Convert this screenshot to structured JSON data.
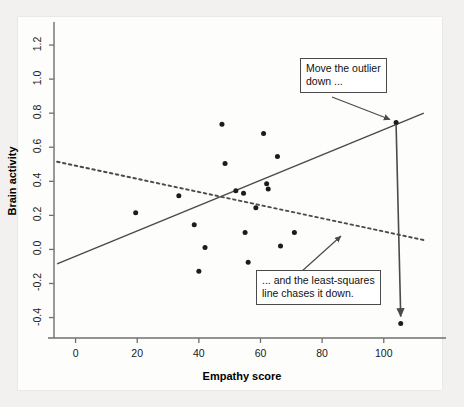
{
  "figure": {
    "background_color": "#f2f1ef",
    "panel_color": "#fdfdfc",
    "point_color": "#1c1c1c",
    "line_color": "#4b4b4b"
  },
  "annotations": {
    "top": {
      "line1": "Move the outlier",
      "line2": "down ..."
    },
    "bottom": {
      "line1": "... and the least-squares",
      "line2": "line chases it down."
    }
  },
  "chart_data": {
    "type": "scatter",
    "title": "",
    "xlabel": "Empathy score",
    "ylabel": "Brain activity",
    "xlim": [
      -7,
      115
    ],
    "ylim": [
      -0.52,
      1.3
    ],
    "xticks": [
      0,
      20,
      40,
      60,
      80,
      100
    ],
    "xticklabels": [
      "0",
      "20",
      "40",
      "60",
      "80",
      "100"
    ],
    "yticks": [
      -0.4,
      -0.2,
      0.0,
      0.2,
      0.4,
      0.6,
      0.8,
      1.0,
      1.2
    ],
    "yticklabels": [
      "-0.4",
      "-0.2",
      "0.0",
      "0.2",
      "0.4",
      "0.6",
      "0.8",
      "1.0",
      "1.2"
    ],
    "grid": false,
    "legend": false,
    "points": [
      {
        "x": 19.5,
        "y": 0.215
      },
      {
        "x": 33.5,
        "y": 0.315
      },
      {
        "x": 38.5,
        "y": 0.145
      },
      {
        "x": 40.0,
        "y": -0.128
      },
      {
        "x": 42.0,
        "y": 0.012
      },
      {
        "x": 47.5,
        "y": 0.735
      },
      {
        "x": 48.5,
        "y": 0.505
      },
      {
        "x": 52.0,
        "y": 0.345
      },
      {
        "x": 54.5,
        "y": 0.33
      },
      {
        "x": 55.0,
        "y": 0.1
      },
      {
        "x": 56.0,
        "y": -0.075
      },
      {
        "x": 58.5,
        "y": 0.245
      },
      {
        "x": 61.0,
        "y": 0.68
      },
      {
        "x": 62.0,
        "y": 0.385
      },
      {
        "x": 62.5,
        "y": 0.355
      },
      {
        "x": 65.5,
        "y": 0.545
      },
      {
        "x": 66.5,
        "y": 0.02
      },
      {
        "x": 71.0,
        "y": 0.1
      },
      {
        "x": 104.0,
        "y": 0.745
      },
      {
        "x": 105.5,
        "y": -0.435
      }
    ],
    "outlier_original": {
      "x": 104.0,
      "y": 0.745
    },
    "outlier_moved": {
      "x": 105.5,
      "y": -0.435
    },
    "lines": [
      {
        "name": "solid-regression-line",
        "style": "solid",
        "x0": -6.0,
        "y0": -0.085,
        "x1": 113.0,
        "y1": 0.8
      },
      {
        "name": "dotted-regression-line",
        "style": "dotted",
        "x0": -6.0,
        "y0": 0.515,
        "x1": 113.0,
        "y1": 0.055
      }
    ]
  }
}
